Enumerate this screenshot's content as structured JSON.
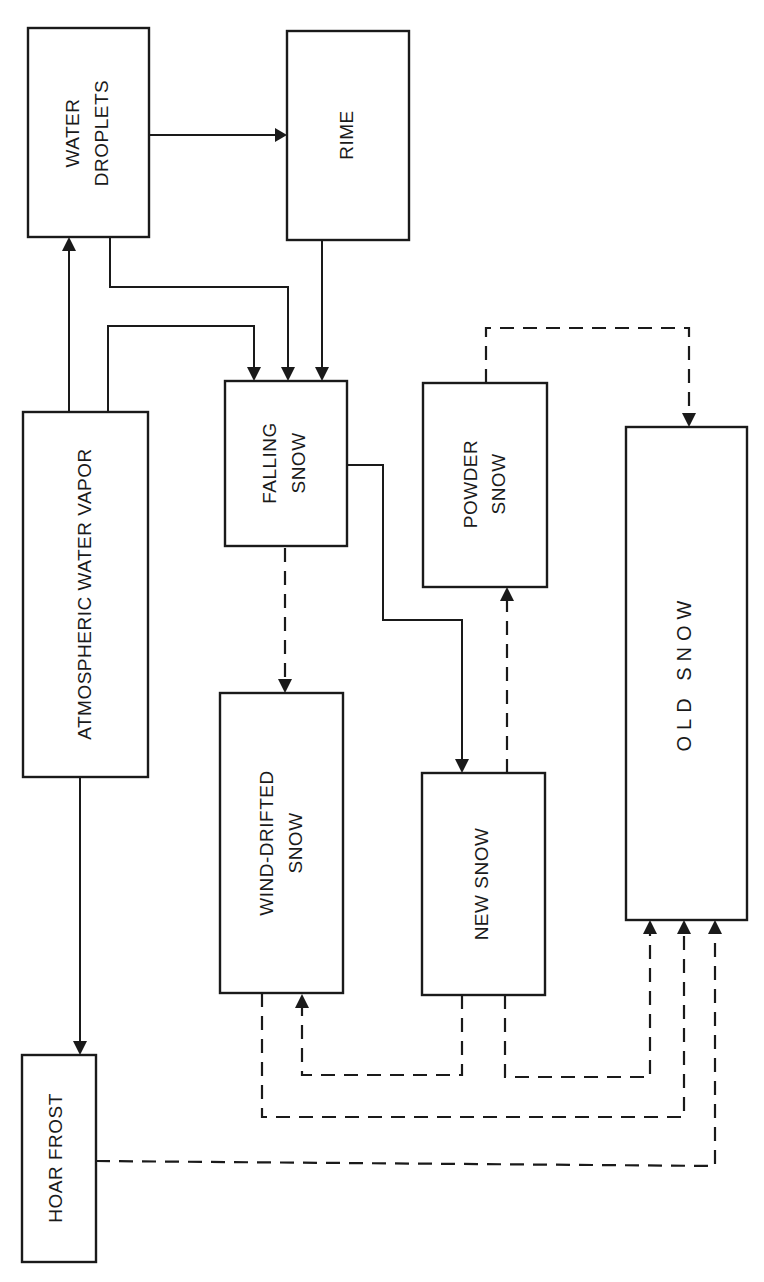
{
  "diagram": {
    "orientation": "rotated 90 degrees counter-clockwise",
    "nodes": {
      "water_droplets": {
        "line1": "WATER",
        "line2": "DROPLETS"
      },
      "rime": {
        "line1": "RIME"
      },
      "atmospheric_water_vapor": {
        "line1": "ATMOSPHERIC WATER VAPOR"
      },
      "falling_snow": {
        "line1": "FALLING",
        "line2": "SNOW"
      },
      "powder_snow": {
        "line1": "POWDER",
        "line2": "SNOW"
      },
      "old_snow": {
        "line1": "OLD SNOW"
      },
      "wind_drifted_snow": {
        "line1": "WIND-DRIFTED",
        "line2": "SNOW"
      },
      "new_snow": {
        "line1": "NEW SNOW"
      },
      "hoar_frost": {
        "line1": "HOAR FROST"
      }
    },
    "edges": [
      {
        "from": "Atmospheric Water Vapor",
        "to": "Water Droplets",
        "style": "solid"
      },
      {
        "from": "Atmospheric Water Vapor",
        "to": "Falling Snow",
        "style": "solid"
      },
      {
        "from": "Atmospheric Water Vapor",
        "to": "Hoar Frost",
        "style": "solid"
      },
      {
        "from": "Water Droplets",
        "to": "Rime",
        "style": "solid"
      },
      {
        "from": "Water Droplets",
        "to": "Falling Snow",
        "style": "solid"
      },
      {
        "from": "Rime",
        "to": "Falling Snow",
        "style": "solid"
      },
      {
        "from": "Falling Snow",
        "to": "New Snow",
        "style": "solid"
      },
      {
        "from": "Falling Snow",
        "to": "Wind-Drifted Snow",
        "style": "dashed"
      },
      {
        "from": "New Snow",
        "to": "Powder Snow",
        "style": "dashed"
      },
      {
        "from": "Powder Snow",
        "to": "Old Snow",
        "style": "dashed"
      },
      {
        "from": "New Snow",
        "to": "Wind-Drifted Snow",
        "style": "dashed"
      },
      {
        "from": "New Snow",
        "to": "Old Snow",
        "style": "dashed"
      },
      {
        "from": "Wind-Drifted Snow",
        "to": "Old Snow",
        "style": "dashed"
      },
      {
        "from": "Hoar Frost",
        "to": "Old Snow",
        "style": "dashed"
      }
    ]
  }
}
